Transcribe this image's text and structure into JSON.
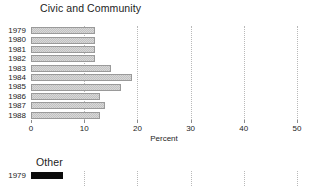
{
  "chart_data": [
    {
      "type": "bar",
      "orientation": "horizontal",
      "title": "Civic and Community",
      "xlabel": "Percent",
      "ylabel": "",
      "categories": [
        "1979",
        "1980",
        "1981",
        "1982",
        "1983",
        "1984",
        "1985",
        "1986",
        "1987",
        "1988"
      ],
      "values": [
        12,
        12,
        12,
        12,
        15,
        19,
        17,
        13,
        14,
        13
      ],
      "xlim": [
        0,
        50
      ],
      "xticks": [
        0,
        10,
        20,
        30,
        40,
        50
      ],
      "xtick_labels": [
        "0",
        "10",
        "20",
        "30",
        "40",
        "50"
      ],
      "grid": "vertical-dotted",
      "legend": "none",
      "bar_style": "light-checkered-fill-gray-border"
    },
    {
      "type": "bar",
      "orientation": "horizontal",
      "title": "Other",
      "xlabel": "",
      "ylabel": "",
      "categories": [
        "1979"
      ],
      "values": [
        6
      ],
      "xlim": [
        0,
        50
      ],
      "xticks": [
        0,
        10,
        20,
        30,
        40,
        50
      ],
      "grid": "vertical-dotted",
      "legend": "none",
      "bar_style": "solid-black",
      "note": "panel is cropped at the bottom edge of the screenshot"
    }
  ],
  "panels": {
    "civic": {
      "title": "Civic and Community",
      "axis_label": "Percent",
      "rows": [
        {
          "year": "1979",
          "value": 12
        },
        {
          "year": "1980",
          "value": 12
        },
        {
          "year": "1981",
          "value": 12
        },
        {
          "year": "1982",
          "value": 12
        },
        {
          "year": "1983",
          "value": 15
        },
        {
          "year": "1984",
          "value": 19
        },
        {
          "year": "1985",
          "value": 17
        },
        {
          "year": "1986",
          "value": 13
        },
        {
          "year": "1987",
          "value": 14
        },
        {
          "year": "1988",
          "value": 13
        }
      ],
      "ticks": [
        {
          "value": 0,
          "label": "0"
        },
        {
          "value": 10,
          "label": "10"
        },
        {
          "value": 20,
          "label": "20"
        },
        {
          "value": 30,
          "label": "30"
        },
        {
          "value": 40,
          "label": "40"
        },
        {
          "value": 50,
          "label": "50"
        }
      ]
    },
    "other": {
      "title": "Other",
      "rows": [
        {
          "year": "1979",
          "value": 6
        }
      ],
      "ticks": [
        {
          "value": 0,
          "label": "0"
        },
        {
          "value": 10,
          "label": "10"
        },
        {
          "value": 20,
          "label": "20"
        },
        {
          "value": 30,
          "label": "30"
        },
        {
          "value": 40,
          "label": "40"
        },
        {
          "value": 50,
          "label": "50"
        }
      ]
    }
  },
  "colors": {
    "background": "#ffffff",
    "bar_fill": "#d8d8d8",
    "bar_border": "#9a9a9a",
    "bar_solid": "#0b0b0b",
    "gridline": "#b9b9b9",
    "text": "#242424"
  }
}
